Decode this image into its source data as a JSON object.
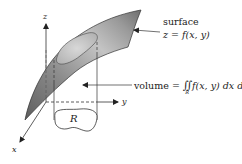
{
  "figure": {
    "axes": {
      "x_label": "x",
      "y_label": "y",
      "z_label": "z"
    },
    "surface_label": {
      "title": "surface",
      "equation_lhs": "z",
      "equation_eq": " = ",
      "equation_rhs": "f(x, y)"
    },
    "volume_label": {
      "prefix": "volume = ",
      "integral_symbol": "∬",
      "integral_subscript": "R",
      "integrand": "f(x, y) dx dy"
    },
    "region_label": "R",
    "colors": {
      "surface_dark": "#6e6e6e",
      "surface_mid": "#9a9a9a",
      "surface_light": "#d0d0d0",
      "patch_fill": "#c8c8c8",
      "line": "#333333",
      "background": "#ffffff"
    }
  }
}
